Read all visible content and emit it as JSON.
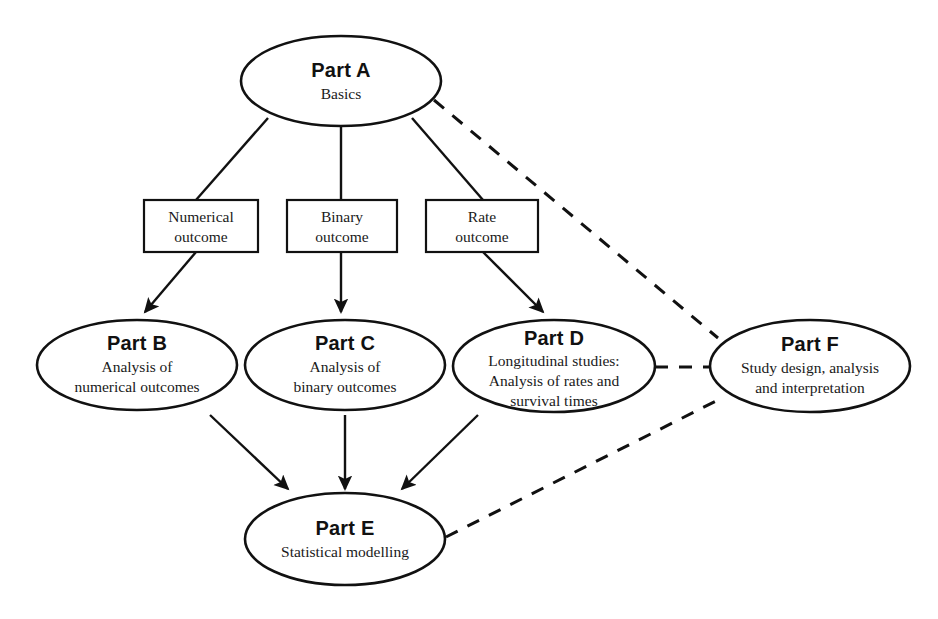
{
  "diagram": {
    "background_color": "#ffffff",
    "stroke_color": "#111111",
    "nodes": [
      {
        "id": "part-a",
        "title": "Part A",
        "subtitle_lines": [
          "Basics"
        ],
        "shape": "ellipse"
      },
      {
        "id": "part-b",
        "title": "Part B",
        "subtitle_lines": [
          "Analysis of",
          "numerical outcomes"
        ],
        "shape": "ellipse"
      },
      {
        "id": "part-c",
        "title": "Part C",
        "subtitle_lines": [
          "Analysis of",
          "binary outcomes"
        ],
        "shape": "ellipse"
      },
      {
        "id": "part-d",
        "title": "Part D",
        "subtitle_lines": [
          "Longitudinal studies:",
          "Analysis of rates and",
          "survival times"
        ],
        "shape": "ellipse"
      },
      {
        "id": "part-e",
        "title": "Part E",
        "subtitle_lines": [
          "Statistical modelling"
        ],
        "shape": "ellipse"
      },
      {
        "id": "part-f",
        "title": "Part F",
        "subtitle_lines": [
          "Study design, analysis",
          "and interpretation"
        ],
        "shape": "ellipse"
      }
    ],
    "boxes": [
      {
        "id": "numerical-outcome",
        "lines": [
          "Numerical",
          "outcome"
        ]
      },
      {
        "id": "binary-outcome",
        "lines": [
          "Binary",
          "outcome"
        ]
      },
      {
        "id": "rate-outcome",
        "lines": [
          "Rate",
          "outcome"
        ]
      }
    ],
    "edges": [
      {
        "id": "a-to-numerical",
        "from": "part-a",
        "to": "numerical-outcome",
        "style": "solid",
        "arrow": false
      },
      {
        "id": "a-to-binary",
        "from": "part-a",
        "to": "binary-outcome",
        "style": "solid",
        "arrow": false
      },
      {
        "id": "a-to-rate",
        "from": "part-a",
        "to": "rate-outcome",
        "style": "solid",
        "arrow": false
      },
      {
        "id": "numerical-to-b",
        "from": "numerical-outcome",
        "to": "part-b",
        "style": "solid",
        "arrow": true
      },
      {
        "id": "binary-to-c",
        "from": "binary-outcome",
        "to": "part-c",
        "style": "solid",
        "arrow": true
      },
      {
        "id": "rate-to-d",
        "from": "rate-outcome",
        "to": "part-d",
        "style": "solid",
        "arrow": true
      },
      {
        "id": "b-to-e",
        "from": "part-b",
        "to": "part-e",
        "style": "solid",
        "arrow": true
      },
      {
        "id": "c-to-e",
        "from": "part-c",
        "to": "part-e",
        "style": "solid",
        "arrow": true
      },
      {
        "id": "d-to-e",
        "from": "part-d",
        "to": "part-e",
        "style": "solid",
        "arrow": true
      },
      {
        "id": "a-to-f",
        "from": "part-a",
        "to": "part-f",
        "style": "dashed",
        "arrow": false
      },
      {
        "id": "d-to-f",
        "from": "part-d",
        "to": "part-f",
        "style": "dashed",
        "arrow": false
      },
      {
        "id": "e-to-f",
        "from": "part-e",
        "to": "part-f",
        "style": "dashed",
        "arrow": false
      }
    ]
  }
}
